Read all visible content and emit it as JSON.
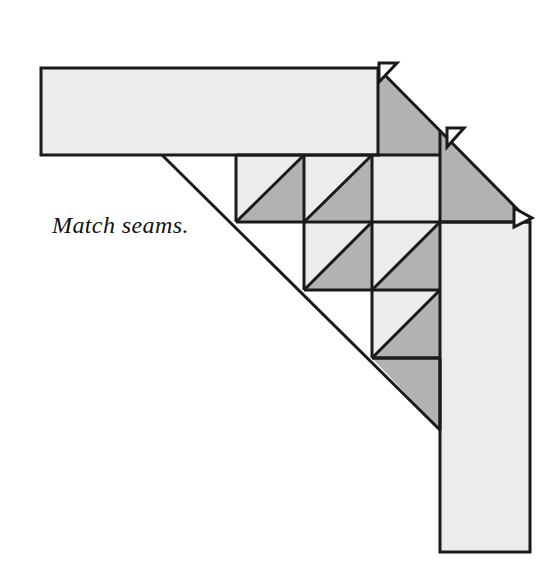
{
  "figure": {
    "kind": "quilting-piecing-diagram",
    "caption": "Match seams.",
    "background_color": "#ffffff",
    "outline_color": "#1a1a1a",
    "fill_light": "#ececec",
    "fill_dark": "#b2b2b2",
    "stroke_width": 3
  },
  "pieces": {
    "top_border_strip": {
      "name": "top border strip",
      "fill": "#ececec",
      "points": "41,68 378,68 378,155 41,155"
    },
    "right_border_strip": {
      "name": "right border strip",
      "fill": "#ececec",
      "points": "440,222 530,222 530,552 440,552"
    },
    "upper_dark_triangle": {
      "name": "upper right dark setting triangle",
      "fill": "#b2b2b2",
      "points": "378,68 530,222 440,222 440,155 378,155"
    },
    "upper_dark_triangle_band": {
      "name": "dark band above pieced row one",
      "fill": "#b2b2b2",
      "points": "378,68 440,130 440,155 378,155"
    },
    "left_dark_band": {
      "name": "left dark setting band",
      "fill": "#b2b2b2",
      "points": "162,155 236,155 236,222 304,222 304,290 372,290 372,358 440,358 440,430"
    }
  },
  "grid": {
    "cell_size": 68,
    "origin_x": 236,
    "origin_y": 155,
    "rows": [
      {
        "row": 1,
        "y": 155,
        "cells": [
          {
            "col": 1,
            "x": 236,
            "type": "half-square-triangle",
            "lower_left": "#ececec",
            "upper_right": "#b2b2b2"
          },
          {
            "col": 2,
            "x": 304,
            "type": "half-square-triangle",
            "lower_left": "#ececec",
            "upper_right": "#b2b2b2"
          },
          {
            "col": 3,
            "x": 372,
            "type": "plain",
            "fill": "#ececec"
          }
        ]
      },
      {
        "row": 2,
        "y": 222,
        "cells": [
          {
            "col": 2,
            "x": 304,
            "type": "half-square-triangle",
            "lower_left": "#ececec",
            "upper_right": "#b2b2b2"
          },
          {
            "col": 3,
            "x": 372,
            "type": "half-square-triangle",
            "lower_left": "#ececec",
            "upper_right": "#b2b2b2"
          }
        ]
      },
      {
        "row": 3,
        "y": 290,
        "cells": [
          {
            "col": 3,
            "x": 372,
            "type": "half-square-triangle",
            "lower_left": "#ececec",
            "upper_right": "#b2b2b2"
          }
        ]
      }
    ]
  },
  "seam_allowance_tabs": [
    {
      "id": 1,
      "name": "seam allowance tab top right",
      "points": "378,60 398,62 378,82"
    },
    {
      "id": 2,
      "name": "seam allowance tab middle right",
      "points": "446,126 466,128 446,148"
    },
    {
      "id": 3,
      "name": "seam allowance tab lower right",
      "points": "512,210 534,214 514,228"
    }
  ],
  "caption": {
    "text": "Match seams.",
    "x": 52,
    "y": 233,
    "font_style": "italic",
    "font_size_px": 24
  }
}
